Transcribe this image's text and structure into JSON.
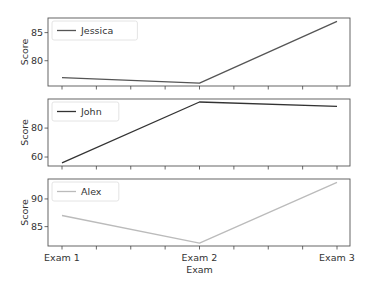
{
  "chart_data": [
    {
      "type": "line",
      "title": "",
      "xlabel": "",
      "ylabel": "Score",
      "categories": [
        "Exam 1",
        "Exam 2",
        "Exam 3"
      ],
      "series": [
        {
          "name": "Jessica",
          "values": [
            77,
            76,
            87
          ],
          "color": "#555555"
        }
      ],
      "yticks": [
        80,
        85
      ],
      "ylim": [
        75.5,
        87.6
      ],
      "legend_position": "upper left",
      "grid": false
    },
    {
      "type": "line",
      "title": "",
      "xlabel": "",
      "ylabel": "Score",
      "categories": [
        "Exam 1",
        "Exam 2",
        "Exam 3"
      ],
      "series": [
        {
          "name": "John",
          "values": [
            56,
            98,
            95
          ],
          "color": "#333333"
        }
      ],
      "yticks": [
        60,
        80
      ],
      "ylim": [
        53.8,
        100.1
      ],
      "legend_position": "upper left",
      "grid": false
    },
    {
      "type": "line",
      "title": "",
      "xlabel": "Exam",
      "ylabel": "Score",
      "categories": [
        "Exam 1",
        "Exam 2",
        "Exam 3"
      ],
      "series": [
        {
          "name": "Alex",
          "values": [
            87,
            82,
            93
          ],
          "color": "#bbbbbb"
        }
      ],
      "yticks": [
        85,
        90
      ],
      "ylim": [
        81.5,
        93.6
      ],
      "legend_position": "upper left",
      "grid": false
    }
  ],
  "x_axis": {
    "label": "Exam",
    "tick_labels": [
      "Exam 1",
      "Exam 2",
      "Exam 3"
    ],
    "minor_tick_count_between": 3
  },
  "layout": {
    "plot_left": 48,
    "plot_right": 350,
    "x_first": 62,
    "x_last": 337,
    "panels": [
      {
        "top": 18,
        "bottom": 86
      },
      {
        "top": 99,
        "bottom": 166
      },
      {
        "top": 179,
        "bottom": 246
      }
    ]
  }
}
